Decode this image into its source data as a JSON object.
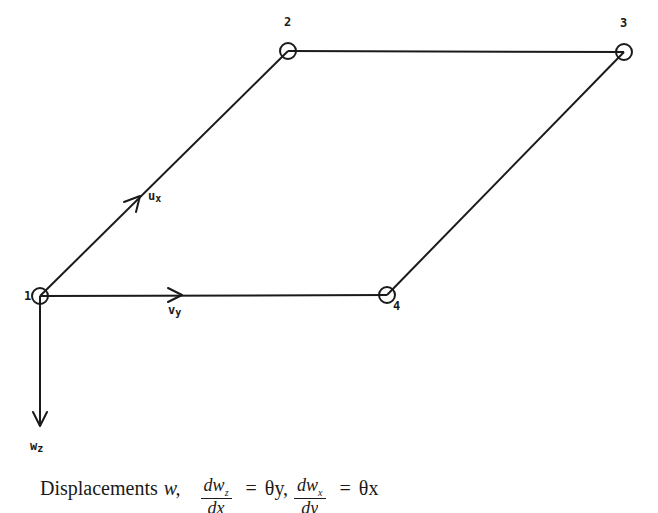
{
  "diagram": {
    "nodes": [
      {
        "id": "1",
        "label": "1",
        "x": 40,
        "y": 296
      },
      {
        "id": "2",
        "label": "2",
        "x": 288,
        "y": 51
      },
      {
        "id": "3",
        "label": "3",
        "x": 624,
        "y": 52
      },
      {
        "id": "4",
        "label": "4",
        "x": 387,
        "y": 295
      }
    ],
    "edges": [
      {
        "from": "1",
        "to": "2"
      },
      {
        "from": "2",
        "to": "3"
      },
      {
        "from": "3",
        "to": "4"
      },
      {
        "from": "4",
        "to": "1"
      }
    ],
    "dof_arrows": [
      {
        "name": "u",
        "sub": "x",
        "label": "Ux",
        "direction": "along edge 1-2"
      },
      {
        "name": "v",
        "sub": "y",
        "label": "Vy",
        "direction": "along edge 1-4"
      },
      {
        "name": "w",
        "sub": "z",
        "label": "Wz",
        "direction": "downward from node 1"
      }
    ],
    "stroke_color": "#1a1a1a",
    "background_color": "#ffffff"
  },
  "caption": {
    "prefix": "Displacements",
    "w": "w,",
    "frac1_num": "dw",
    "frac1_num_sub": "z",
    "frac1_den": "dx",
    "eq1": "=",
    "rhs1": "θy,",
    "frac2_num": "dw",
    "frac2_num_sub": "x",
    "frac2_den": "dy",
    "eq2": "=",
    "rhs2": "θx"
  }
}
